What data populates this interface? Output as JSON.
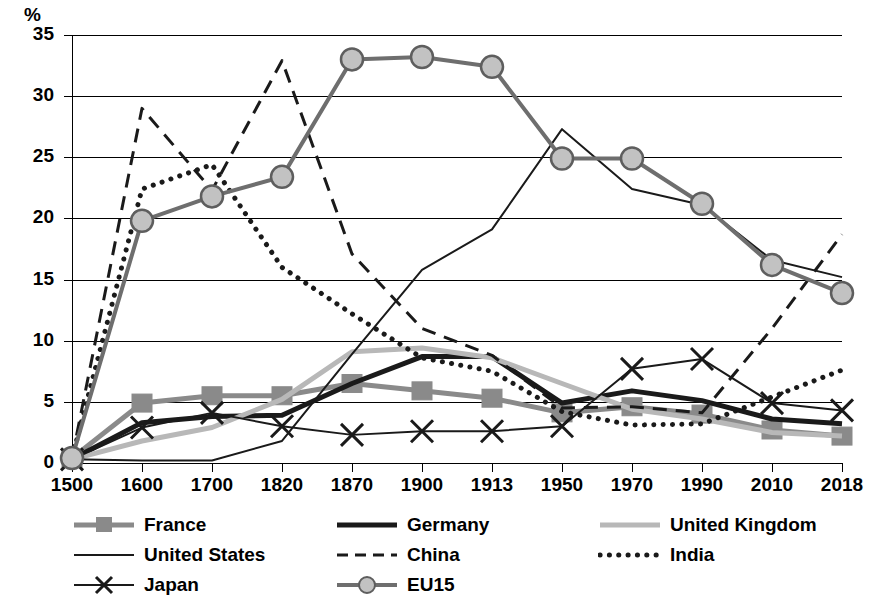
{
  "chart_data": {
    "type": "line",
    "title": "",
    "subtitle": "",
    "xlabel": "",
    "ylabel": "%",
    "unit_label": "%",
    "categories": [
      "1500",
      "1600",
      "1700",
      "1820",
      "1870",
      "1900",
      "1913",
      "1950",
      "1970",
      "1990",
      "2010",
      "2018"
    ],
    "ylim": [
      0,
      35
    ],
    "ytick_step": 5,
    "yticks": [
      "35",
      "30",
      "25",
      "20",
      "15",
      "10",
      "5",
      "0"
    ],
    "grid": "horizontal",
    "legend_position": "bottom",
    "series": [
      {
        "name": "France",
        "marker": "square",
        "line_style": "solid",
        "color": "#8a8a8a",
        "width": 5,
        "values": [
          0.4,
          4.9,
          5.5,
          5.5,
          6.5,
          5.9,
          5.3,
          4.1,
          4.6,
          4.0,
          2.7,
          2.2
        ]
      },
      {
        "name": "Germany",
        "marker": "none",
        "line_style": "solid",
        "color": "#1a1a1a",
        "width": 5,
        "values": [
          0.3,
          3.3,
          3.8,
          3.9,
          6.5,
          8.7,
          8.7,
          4.9,
          5.9,
          5.1,
          3.6,
          3.2
        ]
      },
      {
        "name": "United Kingdom",
        "marker": "none",
        "line_style": "solid",
        "color": "#b8b8b8",
        "width": 5,
        "values": [
          0.3,
          1.8,
          2.9,
          5.2,
          9.1,
          9.4,
          8.6,
          6.5,
          4.4,
          3.6,
          2.5,
          2.2
        ]
      },
      {
        "name": "United States",
        "marker": "none",
        "line_style": "solid",
        "color": "#1a1a1a",
        "width": 2,
        "values": [
          0.3,
          0.2,
          0.2,
          1.8,
          8.9,
          15.8,
          19.1,
          27.3,
          22.4,
          21.1,
          16.6,
          15.2
        ]
      },
      {
        "name": "China",
        "marker": "none",
        "line_style": "dashed",
        "color": "#1a1a1a",
        "width": 3,
        "values": [
          0.4,
          29.0,
          22.3,
          32.9,
          17.1,
          11.0,
          8.8,
          4.5,
          4.6,
          4.1,
          11.0,
          18.7
        ]
      },
      {
        "name": "India",
        "marker": "none",
        "line_style": "dotted",
        "color": "#1a1a1a",
        "width": 5,
        "values": [
          0.4,
          22.4,
          24.4,
          16.0,
          12.2,
          8.6,
          7.5,
          4.2,
          3.1,
          3.2,
          5.4,
          7.6
        ]
      },
      {
        "name": "Japan",
        "marker": "x",
        "line_style": "solid",
        "color": "#1a1a1a",
        "width": 2,
        "values": [
          0.3,
          2.9,
          4.1,
          3.0,
          2.3,
          2.6,
          2.6,
          3.0,
          7.7,
          8.5,
          4.9,
          4.3
        ]
      },
      {
        "name": "EU15",
        "marker": "circle",
        "line_style": "solid",
        "color": "#6e6e6e",
        "width": 4,
        "values": [
          0.4,
          19.8,
          21.8,
          23.4,
          33.0,
          33.2,
          32.4,
          24.9,
          24.9,
          21.2,
          16.2,
          13.9
        ]
      }
    ],
    "legend_layout": {
      "columns": 3,
      "rows": [
        [
          "France",
          "Germany",
          "United Kingdom"
        ],
        [
          "United States",
          "China",
          "India"
        ],
        [
          "Japan",
          "EU15",
          ""
        ]
      ]
    }
  }
}
